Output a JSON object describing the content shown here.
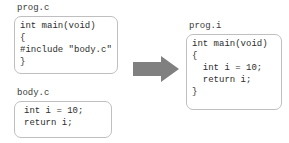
{
  "diagram": {
    "colors": {
      "box_border": "#bfbfbf",
      "box_background": "#ffffff",
      "text": "#2e2e2e",
      "label_text": "#3c3c3c",
      "arrow_fill": "#808080",
      "page_background": "#ffffff"
    },
    "arrow": {
      "icon": "right-block-arrow",
      "direction": "right",
      "label": ""
    },
    "files": [
      {
        "id": "progc",
        "label": "prog.c",
        "lines": [
          "int main(void)",
          "{",
          "#include \"body.c\"",
          "}"
        ]
      },
      {
        "id": "bodyc",
        "label": "body.c",
        "lines": [
          "int i = 10;",
          "return i;"
        ]
      },
      {
        "id": "progi",
        "label": "prog.i",
        "lines": [
          "int main(void)",
          "{",
          "  int i = 10;",
          "  return i;",
          "}"
        ]
      }
    ]
  }
}
